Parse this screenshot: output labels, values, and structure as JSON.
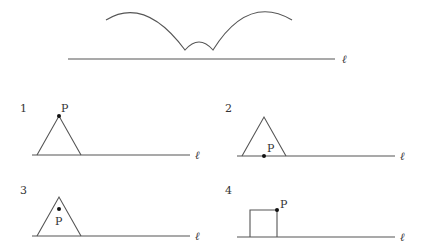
{
  "top_figure": {
    "line_label": "ℓ"
  },
  "panels": [
    {
      "number": "1",
      "point_label": "P",
      "line_label": "ℓ",
      "shape": "triangle",
      "point_position": "apex"
    },
    {
      "number": "2",
      "point_label": "P",
      "line_label": "ℓ",
      "shape": "triangle",
      "point_position": "base midpoint on line"
    },
    {
      "number": "3",
      "point_label": "P",
      "line_label": "ℓ",
      "shape": "triangle",
      "point_position": "interior"
    },
    {
      "number": "4",
      "point_label": "P",
      "line_label": "ℓ",
      "shape": "square",
      "point_position": "top-right corner"
    }
  ]
}
